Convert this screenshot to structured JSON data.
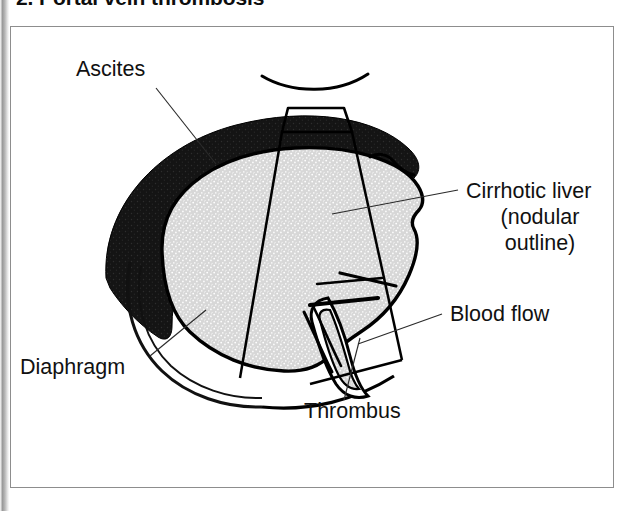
{
  "figure": {
    "title": "2. Portal vein thrombosis",
    "frame_border_color": "#8d8d8d",
    "background_color": "#ffffff"
  },
  "colors": {
    "ascites_fill": "#1a1a1a",
    "liver_fill": "#d9d9d9",
    "outline": "#000000",
    "label_text": "#111111",
    "leader_line": "#2b2b2b",
    "title_text": "#0d0d0d"
  },
  "labels": {
    "ascites": "Ascites",
    "cirrhotic_liver_line1": "Cirrhotic liver",
    "cirrhotic_liver_line2": "(nodular",
    "cirrhotic_liver_line3": "outline)",
    "blood_flow": "Blood flow",
    "diaphragm": "Diaphragm",
    "thrombus": "Thrombus"
  },
  "structures": [
    {
      "name": "ascites",
      "description": "Black crescent of free fluid surrounding the upper and left aspect of the liver",
      "fill": "#1a1a1a"
    },
    {
      "name": "cirrhotic-liver",
      "description": "Light grey stippled liver parenchyma with irregular nodular surface outline",
      "fill": "#d9d9d9"
    },
    {
      "name": "diaphragm",
      "description": "Thin double-line arc along the inferior left margin of the liver",
      "fill": "none"
    },
    {
      "name": "portal-vein",
      "description": "White tapering vessel channel entering the liver from below with thick walls",
      "fill": "#ffffff"
    },
    {
      "name": "thrombus",
      "description": "Echogenic clot occupying the portal vein lumen",
      "fill": "#d9d9d9"
    },
    {
      "name": "blood-flow-marker",
      "description": "Thick straight stroke indicating direction of portal blood flow",
      "fill": "none"
    },
    {
      "name": "ultrasound-transducer",
      "description": "Trapezoidal probe footprint at the top with fanning scan sector lines",
      "fill": "none"
    },
    {
      "name": "skin-surface-arc",
      "description": "Curved line above the transducer representing the body surface",
      "fill": "none"
    }
  ]
}
